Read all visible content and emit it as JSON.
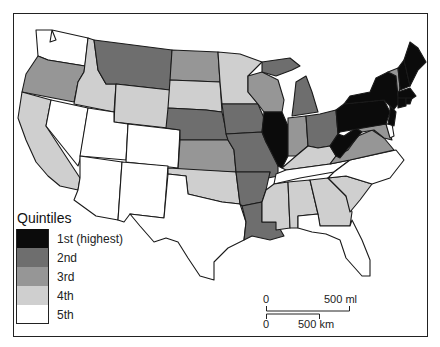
{
  "map": {
    "type": "choropleth",
    "region": "Contiguous United States",
    "legend": {
      "title": "Quintiles",
      "items": [
        {
          "label": "1st (highest)",
          "color": "#0b0b0b"
        },
        {
          "label": "2nd",
          "color": "#6e6e6e"
        },
        {
          "label": "3rd",
          "color": "#969696"
        },
        {
          "label": "4th",
          "color": "#cfcfcf"
        },
        {
          "label": "5th",
          "color": "#ffffff"
        }
      ]
    },
    "scale_bar": {
      "miles": {
        "start": "0",
        "end": "500 ml"
      },
      "km": {
        "start": "0",
        "end": "500 km"
      }
    },
    "states": {
      "WA": "5th",
      "OR": "3rd",
      "CA": "4th",
      "ID": "4th",
      "NV": "5th",
      "UT": "5th",
      "AZ": "5th",
      "MT": "2nd",
      "WY": "4th",
      "CO": "5th",
      "NM": "5th",
      "ND": "3rd",
      "SD": "4th",
      "NE": "2nd",
      "KS": "3rd",
      "OK": "4th",
      "TX": "5th",
      "MN": "4th",
      "IA": "2nd",
      "MO": "2nd",
      "AR": "2nd",
      "LA": "2nd",
      "WI": "3rd",
      "IL": "1st",
      "MI": "2nd",
      "IN": "3rd",
      "OH": "2nd",
      "KY": "4th",
      "TN": "5th",
      "MS": "4th",
      "AL": "4th",
      "GA": "4th",
      "FL": "5th",
      "SC": "4th",
      "NC": "5th",
      "VA": "3rd",
      "WV": "1st",
      "MD": "3rd",
      "DE": "5th",
      "PA": "1st",
      "NY": "1st",
      "NJ": "1st",
      "CT": "1st",
      "RI": "1st",
      "MA": "1st",
      "VT": "3rd",
      "NH": "1st",
      "ME": "1st"
    }
  }
}
